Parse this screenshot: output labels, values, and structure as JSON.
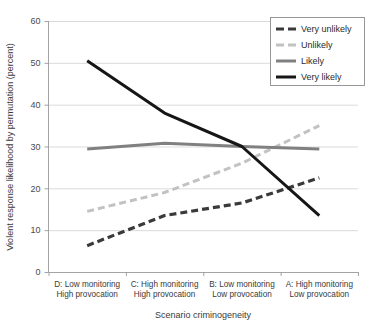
{
  "chart_data": {
    "type": "line",
    "title": "",
    "xlabel": "Scenario criminogeneity",
    "ylabel": "Violent response likelihood by permutation (percent)",
    "categories": [
      "D: Low monitoring\nHigh provocation",
      "C: High monitoring\nHigh provocation",
      "B: Low monitoring\nLow provocation",
      "A: High monitoring\nLow provocation"
    ],
    "category_lines": [
      [
        "D: Low monitoring",
        "High provocation"
      ],
      [
        "C: High monitoring",
        "High provocation"
      ],
      [
        "B: Low monitoring",
        "Low provocation"
      ],
      [
        "A: High monitoring",
        "Low provocation"
      ]
    ],
    "ylim": [
      0,
      60
    ],
    "yticks": [
      0,
      10,
      20,
      30,
      40,
      50,
      60
    ],
    "ytick_labels": [
      "0",
      "10",
      "20",
      "30",
      "40",
      "50",
      "60"
    ],
    "grid": "horizontal",
    "legend_position": "top-right",
    "series": [
      {
        "name": "Very unlikely",
        "values": [
          6.3,
          13.5,
          16.5,
          22.5
        ],
        "color": "#3a3a3a",
        "style": "dashed",
        "width": 3.2,
        "dash": "7,4"
      },
      {
        "name": "Unlikely",
        "values": [
          14.5,
          19.0,
          26.0,
          35.0
        ],
        "color": "#c2c2c2",
        "style": "dashed",
        "width": 3.0,
        "dash": "7,4"
      },
      {
        "name": "Likely",
        "values": [
          29.4,
          30.8,
          30.0,
          29.4
        ],
        "color": "#808080",
        "style": "solid",
        "width": 3.0,
        "dash": "none"
      },
      {
        "name": "Very likely",
        "values": [
          50.5,
          38.0,
          30.0,
          13.5
        ],
        "color": "#161616",
        "style": "solid",
        "width": 3.0,
        "dash": "none"
      }
    ]
  },
  "legend": {
    "entries": [
      "Very unlikely",
      "Unlikely",
      "Likely",
      "Very likely"
    ]
  },
  "axes": {
    "y_title": "Violent response likelihood by permutation (percent)",
    "x_title": "Scenario criminogeneity"
  }
}
